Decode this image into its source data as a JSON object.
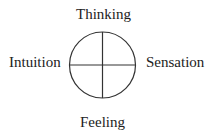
{
  "diagram": {
    "labels": {
      "top": "Thinking",
      "left": "Intuition",
      "right": "Sensation",
      "bottom": "Feeling"
    },
    "stroke_color": "#333333"
  }
}
